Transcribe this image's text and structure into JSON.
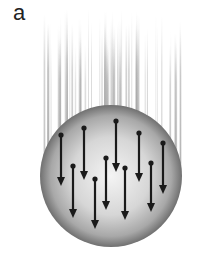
{
  "panel": {
    "label": "a"
  },
  "figure": {
    "sphere": {
      "cx": 111,
      "cy": 176,
      "r": 71,
      "fill_center": "#f2f2f2",
      "fill_edge": "#6e6e6e"
    },
    "streak_color": "#9a9a9a",
    "arrow_color": "#1a1a1a",
    "arrows": [
      {
        "x": 61,
        "y1": 135,
        "y2": 186
      },
      {
        "x": 84,
        "y1": 128,
        "y2": 180
      },
      {
        "x": 116,
        "y1": 121,
        "y2": 172
      },
      {
        "x": 139,
        "y1": 133,
        "y2": 182
      },
      {
        "x": 163,
        "y1": 143,
        "y2": 194
      },
      {
        "x": 73,
        "y1": 166,
        "y2": 218
      },
      {
        "x": 106,
        "y1": 158,
        "y2": 210
      },
      {
        "x": 95,
        "y1": 179,
        "y2": 229
      },
      {
        "x": 125,
        "y1": 168,
        "y2": 220
      },
      {
        "x": 151,
        "y1": 163,
        "y2": 212
      }
    ]
  }
}
